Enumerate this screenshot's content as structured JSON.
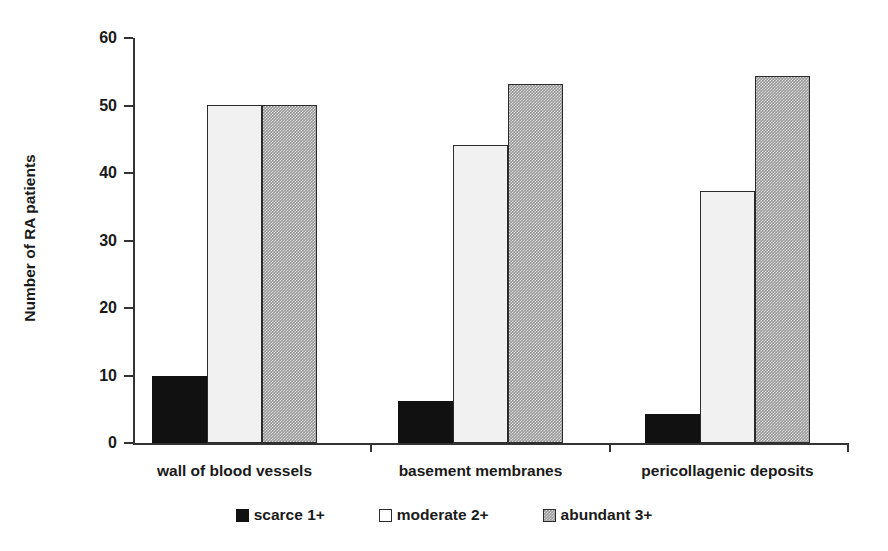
{
  "chart_data": {
    "type": "bar",
    "title": "",
    "xlabel": "",
    "ylabel": "Number of RA patients",
    "categories": [
      "wall of blood vessels",
      "basement membranes",
      "pericollagenic deposits"
    ],
    "series": [
      {
        "name": "scarce 1+",
        "values": [
          10.0,
          6.2,
          4.3
        ]
      },
      {
        "name": "moderate 2+",
        "values": [
          50.1,
          44.2,
          37.3
        ]
      },
      {
        "name": "abundant 3+",
        "values": [
          50.1,
          53.2,
          54.3
        ]
      }
    ],
    "ylim": [
      0,
      60
    ],
    "ytick_labels": [
      "0",
      "10",
      "20",
      "30",
      "40",
      "50",
      "60"
    ],
    "ytick_values": [
      0,
      10,
      20,
      30,
      40,
      50,
      60
    ],
    "grid": false,
    "legend_position": "bottom-center",
    "colors": {
      "scarce": "#111111",
      "moderate": "#f1f1f1",
      "abundant": "#9a9a9a",
      "axis": "#333333",
      "text": "#1a1a1a",
      "background": "#ffffff"
    }
  },
  "legend": {
    "items": [
      {
        "label": "scarce 1+",
        "swatch": "black-square-swatch"
      },
      {
        "label": "moderate 2+",
        "swatch": "white-square-swatch"
      },
      {
        "label": "abundant 3+",
        "swatch": "gray-hatched-square-swatch"
      }
    ]
  }
}
